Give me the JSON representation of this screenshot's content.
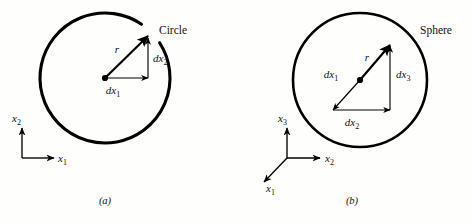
{
  "figure": {
    "background_color": "#fefefc",
    "ink_color": "#000000",
    "width": 472,
    "height": 224
  },
  "panels": [
    {
      "id": "a",
      "caption": "(a)",
      "shape_label": "Circle",
      "shape_type": "circle",
      "center": {
        "x": 105,
        "y": 78
      },
      "radius": 65,
      "stroke_width": 3.1,
      "has_gap_at_vector_exit": true,
      "vectors": [
        {
          "name": "r",
          "label": "r",
          "subscript": "",
          "from": {
            "x": 105,
            "y": 78
          },
          "to": {
            "x": 148,
            "y": 36
          },
          "weight": "thick",
          "label_pos": {
            "x": 117,
            "y": 53
          }
        },
        {
          "name": "dx1",
          "label": "dx",
          "subscript": "1",
          "from": {
            "x": 105,
            "y": 78
          },
          "to": {
            "x": 148,
            "y": 78
          },
          "weight": "thin",
          "label_pos": {
            "x": 113,
            "y": 94
          }
        },
        {
          "name": "dx2",
          "label": "dx",
          "subscript": "2",
          "from": {
            "x": 148,
            "y": 78
          },
          "to": {
            "x": 148,
            "y": 38
          },
          "weight": "thin",
          "label_pos": {
            "x": 153,
            "y": 62
          }
        }
      ],
      "axes": {
        "origin": {
          "x": 22,
          "y": 158
        },
        "items": [
          {
            "name": "x2",
            "label": "x",
            "subscript": "2",
            "to": {
              "x": 22,
              "y": 128
            },
            "label_pos": {
              "x": 12,
              "y": 122
            }
          },
          {
            "name": "x1",
            "label": "x",
            "subscript": "1",
            "to": {
              "x": 54,
              "y": 158
            },
            "label_pos": {
              "x": 58,
              "y": 162
            }
          }
        ]
      },
      "shape_label_pos": {
        "x": 159,
        "y": 34
      },
      "caption_pos": {
        "x": 105,
        "y": 204
      }
    },
    {
      "id": "b",
      "caption": "(b)",
      "shape_label": "Sphere",
      "shape_type": "circle",
      "center": {
        "x": 360,
        "y": 80
      },
      "radius": 67,
      "stroke_width": 2.6,
      "has_gap_at_vector_exit": false,
      "vectors": [
        {
          "name": "r",
          "label": "r",
          "subscript": "",
          "from": {
            "x": 360,
            "y": 80
          },
          "to": {
            "x": 390,
            "y": 45
          },
          "weight": "thick",
          "label_pos": {
            "x": 367,
            "y": 61
          }
        },
        {
          "name": "dx1",
          "label": "dx",
          "subscript": "1",
          "from": {
            "x": 360,
            "y": 80
          },
          "to": {
            "x": 333,
            "y": 110
          },
          "weight": "thin",
          "label_pos": {
            "x": 331,
            "y": 78
          }
        },
        {
          "name": "dx2",
          "label": "dx",
          "subscript": "2",
          "from": {
            "x": 333,
            "y": 110
          },
          "to": {
            "x": 390,
            "y": 110
          },
          "weight": "thin",
          "label_pos": {
            "x": 352,
            "y": 126
          }
        },
        {
          "name": "dx3",
          "label": "dx",
          "subscript": "3",
          "from": {
            "x": 390,
            "y": 110
          },
          "to": {
            "x": 390,
            "y": 46
          },
          "weight": "thin",
          "label_pos": {
            "x": 396,
            "y": 78
          }
        }
      ],
      "axes": {
        "origin": {
          "x": 287,
          "y": 158
        },
        "items": [
          {
            "name": "x3",
            "label": "x",
            "subscript": "3",
            "to": {
              "x": 287,
              "y": 128
            },
            "label_pos": {
              "x": 278,
              "y": 122
            }
          },
          {
            "name": "x2",
            "label": "x",
            "subscript": "2",
            "to": {
              "x": 320,
              "y": 158
            },
            "label_pos": {
              "x": 325,
              "y": 162
            }
          },
          {
            "name": "x1",
            "label": "x",
            "subscript": "1",
            "to": {
              "x": 264,
              "y": 182
            },
            "label_pos": {
              "x": 266,
              "y": 192
            }
          }
        ]
      },
      "shape_label_pos": {
        "x": 420,
        "y": 34
      },
      "caption_pos": {
        "x": 352,
        "y": 204
      }
    }
  ]
}
